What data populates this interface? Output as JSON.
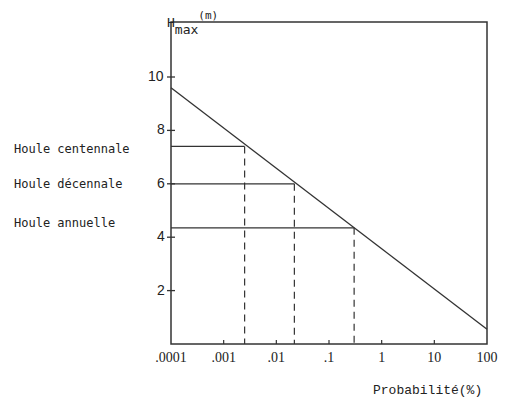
{
  "chart_data": {
    "type": "line",
    "title": "",
    "xlabel": "Probabilité(%)",
    "ylabel": "Hmax(m)",
    "ylabel_main": "H",
    "ylabel_sub": "max",
    "ylabel_unit": "(m)",
    "x_scale": "log",
    "xlim": [
      0.0001,
      100
    ],
    "ylim": [
      0,
      11.5
    ],
    "x_ticks": [
      ".0001",
      ".001",
      ".01",
      ".1",
      "1",
      "10",
      "100"
    ],
    "x_tick_values": [
      0.0001,
      0.001,
      0.01,
      0.1,
      1,
      10,
      100
    ],
    "y_ticks": [
      "2",
      "4",
      "6",
      "8",
      "10"
    ],
    "y_tick_values": [
      2,
      4,
      6,
      8,
      10
    ],
    "grid": false,
    "series": [
      {
        "name": "Hmax",
        "x": [
          0.0001,
          100
        ],
        "values": [
          9.6,
          0.55
        ],
        "style": "solid"
      }
    ],
    "annotations": [
      {
        "label": "Houle centennale",
        "y": 7.4,
        "x": 0.0025
      },
      {
        "label": "Houle décennale",
        "y": 6.0,
        "x": 0.022
      },
      {
        "label": "Houle annuelle",
        "y": 4.35,
        "x": 0.3
      }
    ]
  }
}
